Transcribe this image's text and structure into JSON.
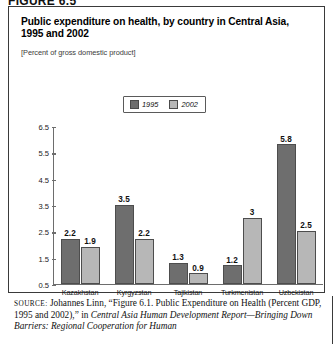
{
  "figure_header": "FIGURE 6.5",
  "title": "Public expenditure on health, by country in Central Asia, 1995 and 2002",
  "subtitle": "[Percent of gross domestic product]",
  "legend": {
    "items": [
      {
        "label": "1995",
        "color": "#6e6e6e"
      },
      {
        "label": "2002",
        "color": "#b7b7b7"
      }
    ]
  },
  "source": {
    "label": "SOURCE:",
    "line1": "Johannes Linn, “Figure 6.1. Public Expenditure on Health",
    "line2_plain": "(Percent GDP, 1995 and 2002),” in ",
    "line2_italic": "Central Asia Human Development",
    "line3_italic": "Report—Bringing Down Barriers: Regional Cooperation for Human"
  },
  "chart_data": {
    "type": "bar",
    "title": "Public expenditure on health, by country in Central Asia, 1995 and 2002",
    "subtitle": "[Percent of gross domestic product]",
    "xlabel": "",
    "ylabel": "",
    "ylim": [
      0.5,
      6.5
    ],
    "yticks": [
      0.5,
      1.5,
      2.5,
      3.5,
      4.5,
      5.5,
      6.5
    ],
    "ytick_labels": [
      "0.5",
      "1.5",
      "2.5",
      "3.5",
      "4.5",
      "5.5",
      "6.5"
    ],
    "grid": false,
    "legend_position": "top-center",
    "categories": [
      "Kazakhstan",
      "Kyrgyzstan",
      "Tajikistan",
      "Turkmenistan",
      "Uzbekistan"
    ],
    "series": [
      {
        "name": "1995",
        "color": "#6e6e6e",
        "values": [
          2.2,
          3.5,
          1.3,
          1.2,
          5.8
        ],
        "labels": [
          "2.2",
          "3.5",
          "1.3",
          "1.2",
          "5.8"
        ]
      },
      {
        "name": "2002",
        "color": "#b7b7b7",
        "values": [
          1.9,
          2.2,
          0.9,
          3.0,
          2.5
        ],
        "labels": [
          "1.9",
          "2.2",
          "0.9",
          "3",
          "2.5"
        ]
      }
    ]
  }
}
